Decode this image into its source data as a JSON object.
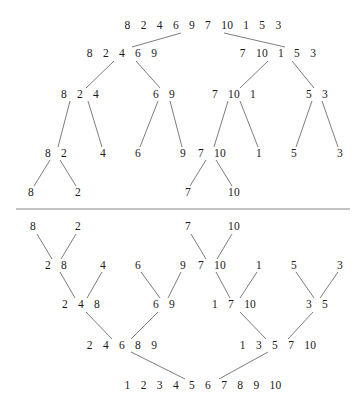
{
  "diagram": {
    "colors": {
      "text": "#1a1a1a",
      "edge": "#6e6e6e",
      "divider": "#8a8a8a",
      "background": "#ffffff"
    },
    "divider": {
      "x1": 16,
      "x2": 350,
      "y": 209
    },
    "split_phase": {
      "nodes": [
        {
          "id": "s0",
          "label": "8  2  4  6  9  7  10  1  5  3",
          "x": 203,
          "y": 26
        },
        {
          "id": "s1a",
          "label": "8  2  4  6  9",
          "x": 122,
          "y": 54
        },
        {
          "id": "s1b",
          "label": "7  10  1  5  3",
          "x": 278,
          "y": 54
        },
        {
          "id": "s2a",
          "label": "8  2  4",
          "x": 80,
          "y": 95
        },
        {
          "id": "s2b",
          "label": "6  9",
          "x": 164,
          "y": 95
        },
        {
          "id": "s2c",
          "label": "7  10  1",
          "x": 234,
          "y": 95
        },
        {
          "id": "s2d",
          "label": "5  3",
          "x": 317,
          "y": 95
        },
        {
          "id": "s3a",
          "label": "8  2",
          "x": 56,
          "y": 154
        },
        {
          "id": "s3b",
          "label": "4",
          "x": 103,
          "y": 154
        },
        {
          "id": "s3c",
          "label": "6",
          "x": 138,
          "y": 154
        },
        {
          "id": "s3d",
          "label": "9",
          "x": 183,
          "y": 154
        },
        {
          "id": "s3e",
          "label": "7  10",
          "x": 212,
          "y": 154
        },
        {
          "id": "s3f",
          "label": "1",
          "x": 259,
          "y": 154
        },
        {
          "id": "s3g",
          "label": "5",
          "x": 294,
          "y": 154
        },
        {
          "id": "s3h",
          "label": "3",
          "x": 340,
          "y": 154
        },
        {
          "id": "s4a",
          "label": "8",
          "x": 31,
          "y": 193
        },
        {
          "id": "s4b",
          "label": "2",
          "x": 78,
          "y": 193
        },
        {
          "id": "s4c",
          "label": "7",
          "x": 188,
          "y": 193
        },
        {
          "id": "s4d",
          "label": "10",
          "x": 234,
          "y": 193
        }
      ],
      "edges": [
        [
          181,
          33,
          132,
          47
        ],
        [
          224,
          33,
          285,
          47
        ],
        [
          114,
          61,
          86,
          88
        ],
        [
          136,
          61,
          160,
          88
        ],
        [
          268,
          61,
          240,
          88
        ],
        [
          292,
          61,
          314,
          88
        ],
        [
          70,
          101,
          58,
          147
        ],
        [
          88,
          101,
          102,
          147
        ],
        [
          158,
          101,
          140,
          147
        ],
        [
          170,
          101,
          182,
          147
        ],
        [
          228,
          101,
          214,
          147
        ],
        [
          240,
          101,
          258,
          147
        ],
        [
          312,
          101,
          296,
          147
        ],
        [
          322,
          101,
          338,
          147
        ],
        [
          50,
          160,
          34,
          186
        ],
        [
          60,
          160,
          76,
          186
        ],
        [
          206,
          160,
          190,
          186
        ],
        [
          216,
          160,
          232,
          186
        ]
      ]
    },
    "merge_phase": {
      "nodes": [
        {
          "id": "m0a",
          "label": "8",
          "x": 33,
          "y": 227
        },
        {
          "id": "m0b",
          "label": "2",
          "x": 78,
          "y": 227
        },
        {
          "id": "m0c",
          "label": "7",
          "x": 188,
          "y": 227
        },
        {
          "id": "m0d",
          "label": "10",
          "x": 234,
          "y": 227
        },
        {
          "id": "m1a",
          "label": "2  8",
          "x": 56,
          "y": 266
        },
        {
          "id": "m1b",
          "label": "4",
          "x": 103,
          "y": 266
        },
        {
          "id": "m1c",
          "label": "6",
          "x": 138,
          "y": 266
        },
        {
          "id": "m1d",
          "label": "9",
          "x": 183,
          "y": 266
        },
        {
          "id": "m1e",
          "label": "7  10",
          "x": 212,
          "y": 266
        },
        {
          "id": "m1f",
          "label": "1",
          "x": 259,
          "y": 266
        },
        {
          "id": "m1g",
          "label": "5",
          "x": 294,
          "y": 266
        },
        {
          "id": "m1h",
          "label": "3",
          "x": 340,
          "y": 266
        },
        {
          "id": "m2a",
          "label": "2  4  8",
          "x": 81,
          "y": 305
        },
        {
          "id": "m2b",
          "label": "6  9",
          "x": 164,
          "y": 305
        },
        {
          "id": "m2c",
          "label": "1  7  10",
          "x": 234,
          "y": 305
        },
        {
          "id": "m2d",
          "label": "3  5",
          "x": 317,
          "y": 305
        },
        {
          "id": "m3a",
          "label": "2  4  6  8  9",
          "x": 122,
          "y": 346
        },
        {
          "id": "m3b",
          "label": "1  3  5  7  10",
          "x": 278,
          "y": 346
        },
        {
          "id": "m4",
          "label": "1  2  3  4  5  6  7  8  9  10",
          "x": 203,
          "y": 386
        }
      ],
      "edges": [
        [
          37,
          234,
          52,
          259
        ],
        [
          76,
          234,
          61,
          259
        ],
        [
          191,
          234,
          206,
          259
        ],
        [
          232,
          234,
          217,
          259
        ],
        [
          60,
          272,
          75,
          298
        ],
        [
          102,
          272,
          87,
          298
        ],
        [
          141,
          272,
          160,
          298
        ],
        [
          181,
          272,
          168,
          298
        ],
        [
          216,
          272,
          230,
          298
        ],
        [
          257,
          272,
          240,
          298
        ],
        [
          296,
          272,
          314,
          298
        ],
        [
          338,
          272,
          320,
          298
        ],
        [
          86,
          312,
          112,
          339
        ],
        [
          158,
          312,
          131,
          339
        ],
        [
          240,
          312,
          266,
          339
        ],
        [
          313,
          312,
          288,
          339
        ],
        [
          131,
          352,
          185,
          379
        ],
        [
          268,
          352,
          219,
          379
        ]
      ]
    }
  }
}
